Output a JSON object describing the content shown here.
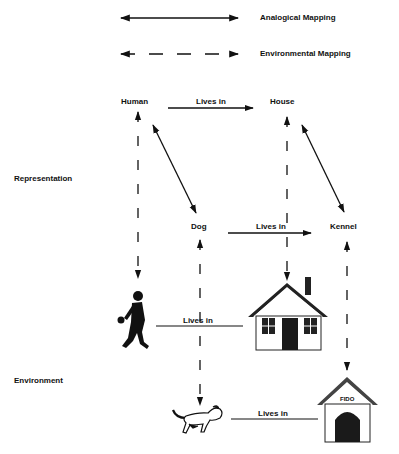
{
  "legend": {
    "analogical": "Analogical Mapping",
    "environmental": "Environmental Mapping"
  },
  "sections": {
    "representation": "Representation",
    "environment": "Environment"
  },
  "nodes": {
    "human": "Human",
    "house": "House",
    "dog": "Dog",
    "kennel": "Kennel"
  },
  "relations": {
    "human_house": "Lives in",
    "dog_kennel": "Lives in",
    "env_human_house": "Lives in",
    "env_dog_kennel": "Lives in"
  },
  "pictures": {
    "person": "walking-person-picture",
    "house": "house-picture",
    "dog": "dog-picture",
    "kennel": "kennel-picture",
    "kennel_sign": "FIDO"
  },
  "colors": {
    "ink": "#111111",
    "background": "#ffffff"
  }
}
